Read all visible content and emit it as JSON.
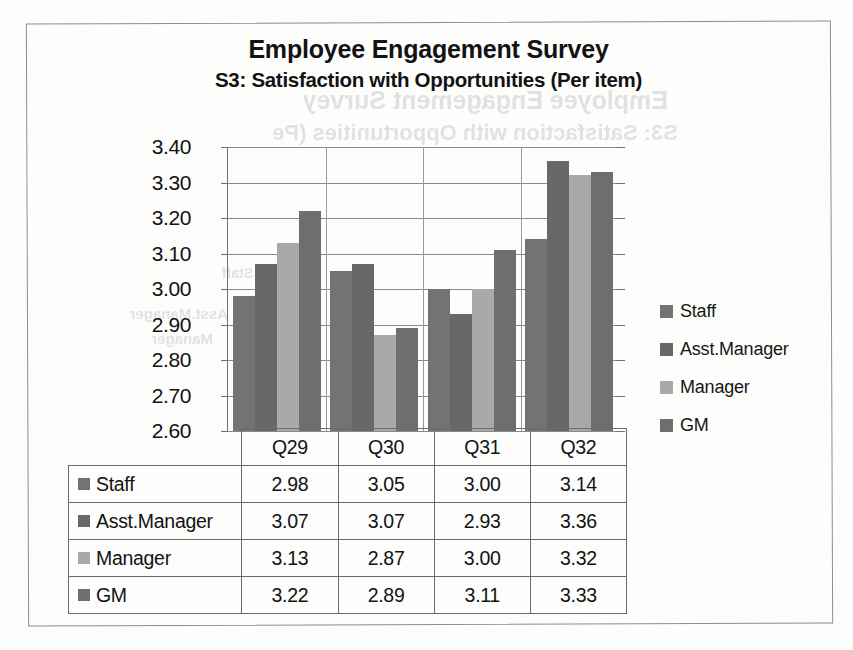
{
  "document": {
    "type": "scanned-chart-page",
    "frame_border_color": "#8e8e8e",
    "background": "#fdfdfc"
  },
  "title": {
    "main": "Employee Engagement Survey",
    "sub": "S3: Satisfaction with Opportunities (Per item)"
  },
  "scan_artifacts": {
    "bleed_through": [
      "Employee Engagement Survey",
      "S3: Satisfaction with Opportunities (Pe",
      "Asst.Manager",
      "Manager",
      "Staff"
    ]
  },
  "chart_data": {
    "type": "bar",
    "title": "Employee Engagement Survey\nS3: Satisfaction with Opportunities (Per item)",
    "xlabel": "",
    "ylabel": "",
    "categories": [
      "Q29",
      "Q30",
      "Q31",
      "Q32"
    ],
    "series": [
      {
        "name": "Staff",
        "values": [
          2.98,
          3.05,
          3.0,
          3.14
        ],
        "color": "#737373"
      },
      {
        "name": "Asst.Manager",
        "values": [
          3.07,
          3.07,
          2.93,
          3.36
        ],
        "color": "#686868"
      },
      {
        "name": "Manager",
        "values": [
          3.13,
          2.87,
          3.0,
          3.32
        ],
        "color": "#a9a9a9"
      },
      {
        "name": "GM",
        "values": [
          3.22,
          2.89,
          3.11,
          3.33
        ],
        "color": "#6e6e6e"
      }
    ],
    "ylim": [
      2.6,
      3.4
    ],
    "ytick_step": 0.1,
    "yticks": [
      "3.40",
      "3.30",
      "3.20",
      "3.10",
      "3.00",
      "2.90",
      "2.80",
      "2.70",
      "2.60"
    ],
    "grid": true,
    "grid_axis": "y",
    "legend_position": "right",
    "has_data_table": true
  },
  "legend": {
    "entries": [
      {
        "label": "Staff",
        "color": "#737373"
      },
      {
        "label": "Asst.Manager",
        "color": "#686868"
      },
      {
        "label": "Manager",
        "color": "#a9a9a9"
      },
      {
        "label": "GM",
        "color": "#6e6e6e"
      }
    ]
  },
  "data_table": {
    "corner": "",
    "columns": [
      "Q29",
      "Q30",
      "Q31",
      "Q32"
    ],
    "rows": [
      {
        "label": "Staff",
        "color": "#737373",
        "values": [
          "2.98",
          "3.05",
          "3.00",
          "3.14"
        ]
      },
      {
        "label": "Asst.Manager",
        "color": "#686868",
        "values": [
          "3.07",
          "3.07",
          "2.93",
          "3.36"
        ]
      },
      {
        "label": "Manager",
        "color": "#a9a9a9",
        "values": [
          "3.13",
          "2.87",
          "3.00",
          "3.32"
        ]
      },
      {
        "label": "GM",
        "color": "#6e6e6e",
        "values": [
          "3.22",
          "2.89",
          "3.11",
          "3.33"
        ]
      }
    ]
  }
}
